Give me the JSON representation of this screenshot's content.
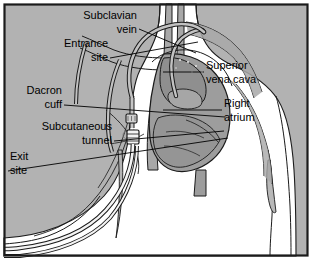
{
  "figure": {
    "frame": {
      "border_color": "#1b1b1b",
      "background_color": "#b2b2b2",
      "body_color": "#ffffff",
      "vessel_color": "#a8a8a8",
      "heart_color": "#9d9d9d",
      "catheter_color": "#b6b6b6",
      "ink_color": "#1b1b1b"
    },
    "labels": [
      {
        "id": "subclavian-vein",
        "lines": [
          "Subclavian",
          "vein"
        ],
        "align": "right",
        "text_x": 137,
        "text_y": 16,
        "line_height": 14,
        "leader": "M139,29 L196,53"
      },
      {
        "id": "entrance-site",
        "lines": [
          "Entrance",
          "site"
        ],
        "align": "right",
        "text_x": 108,
        "text_y": 44,
        "line_height": 14,
        "leader": "M110,58 L198,42"
      },
      {
        "id": "dacron-cuff",
        "lines": [
          "Dacron",
          "cuff"
        ],
        "align": "right",
        "text_x": 62,
        "text_y": 91,
        "line_height": 14,
        "leader": "M64,105 L225,117"
      },
      {
        "id": "subcutaneous-tunnel",
        "lines": [
          "Subcutaneous",
          "tunnel"
        ],
        "align": "right",
        "text_x": 112,
        "text_y": 127,
        "line_height": 14,
        "leader": "M114,141 L224,131"
      },
      {
        "id": "exit-site",
        "lines": [
          "Exit",
          "site"
        ],
        "align": "left",
        "text_x": 10,
        "text_y": 157,
        "line_height": 14,
        "leader": "M8,171 L228,138"
      },
      {
        "id": "superior-vena-cava",
        "lines": [
          "Superior",
          "vena cava"
        ],
        "align": "left",
        "text_x": 206,
        "text_y": 66,
        "line_height": 14,
        "leader": "M204,72 L163,72"
      },
      {
        "id": "right-atrium",
        "lines": [
          "Right",
          "atrium"
        ],
        "align": "left",
        "text_x": 224,
        "text_y": 104,
        "line_height": 14,
        "leader": "M222,110 L163,110"
      }
    ]
  }
}
